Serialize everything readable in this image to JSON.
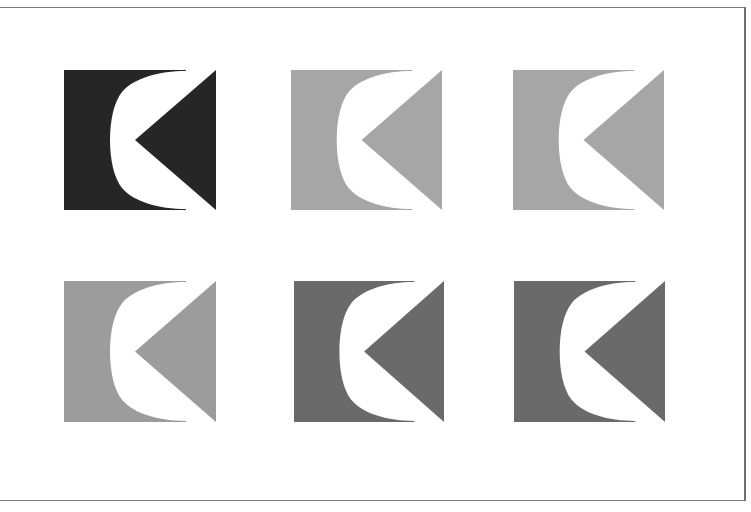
{
  "page": {
    "background": "#ffffff",
    "frame_color": "#7a7a7a"
  },
  "logos": [
    {
      "name": "logo-black",
      "color": "#262626",
      "x": 64,
      "y": 70,
      "w": 152,
      "h": 140
    },
    {
      "name": "logo-light-gray-1",
      "color": "#a6a6a6",
      "x": 291,
      "y": 70,
      "w": 151,
      "h": 140
    },
    {
      "name": "logo-light-gray-2",
      "color": "#a6a6a6",
      "x": 513,
      "y": 70,
      "w": 151,
      "h": 140
    },
    {
      "name": "logo-mid-gray",
      "color": "#9c9c9c",
      "x": 64,
      "y": 281,
      "w": 152,
      "h": 141
    },
    {
      "name": "logo-dark-gray-1",
      "color": "#6a6a6a",
      "x": 294,
      "y": 281,
      "w": 150,
      "h": 141
    },
    {
      "name": "logo-dark-gray-2",
      "color": "#6a6a6a",
      "x": 514,
      "y": 281,
      "w": 151,
      "h": 141
    }
  ]
}
